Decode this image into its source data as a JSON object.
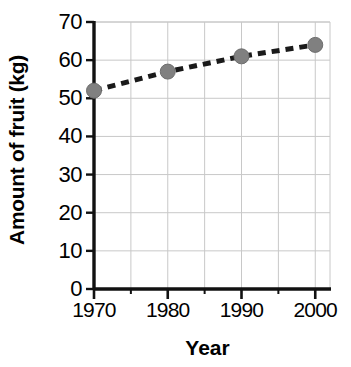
{
  "chart_data": {
    "type": "line",
    "title": "",
    "xlabel": "Year",
    "ylabel": "Amount of fruit (kg)",
    "x": [
      1970,
      1980,
      1990,
      2000
    ],
    "values": [
      52,
      57,
      61,
      64
    ],
    "series": [
      {
        "name": "Amount of fruit",
        "values": [
          52,
          57,
          61,
          64
        ]
      }
    ],
    "xlim": [
      1970,
      2002
    ],
    "ylim": [
      0,
      70
    ],
    "x_ticks": [
      1970,
      1980,
      1990,
      2000
    ],
    "x_tick_labels": [
      "1970",
      "1980",
      "1990",
      "2000"
    ],
    "x_minor_ticks": [
      1975,
      1985,
      1995
    ],
    "y_ticks": [
      0,
      10,
      20,
      30,
      40,
      50,
      60,
      70
    ],
    "y_tick_labels": [
      "0",
      "10",
      "20",
      "30",
      "40",
      "50",
      "60",
      "70"
    ],
    "grid": true,
    "legend": "none",
    "line_style": "dashed",
    "marker": "circle",
    "marker_color": "#808080",
    "line_color": "#1a1a1a",
    "grid_color": "#c8c8c8",
    "axis_color": "#111111",
    "background_color": "#ffffff"
  },
  "axes": {
    "y_title": "Amount of fruit (kg)",
    "x_title": "Year"
  }
}
